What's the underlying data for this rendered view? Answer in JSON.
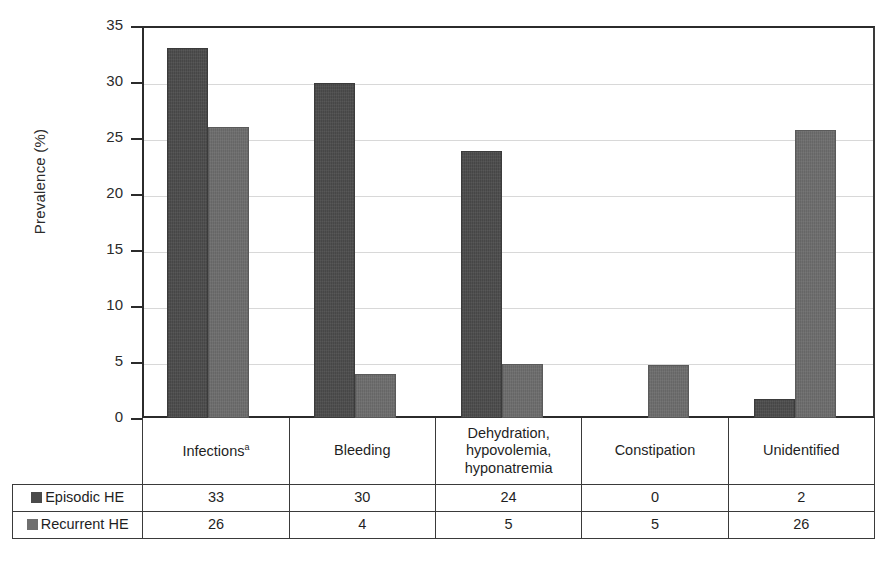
{
  "chart_data": {
    "type": "bar",
    "title": "",
    "xlabel": "",
    "ylabel": "Prevalence (%)",
    "ylim": [
      0,
      35
    ],
    "yticks": [
      0,
      5,
      10,
      15,
      20,
      25,
      30,
      35
    ],
    "ytick_labels": [
      "0",
      "5",
      "10",
      "15",
      "20",
      "25",
      "30",
      "35"
    ],
    "grid": true,
    "grid_axis": "y",
    "legend_position": "table-left-column",
    "categories": [
      "Infections",
      "Bleeding",
      "Dehydration, hypovolemia, hyponatremia",
      "Constipation",
      "Unidentified"
    ],
    "category_labels": [
      "Infectionsᵃ",
      "Bleeding",
      "Dehydration, hypovolemia, hyponatremia",
      "Constipation",
      "Unidentified"
    ],
    "series": [
      {
        "name": "Episodic HE",
        "color": "#4a4a4a",
        "values": [
          33,
          30,
          24,
          0,
          2
        ],
        "drawn_values": [
          33.0,
          29.9,
          23.8,
          0,
          1.7
        ]
      },
      {
        "name": "Recurrent HE",
        "color": "#6b6b6b",
        "values": [
          26,
          4,
          5,
          5,
          26
        ],
        "drawn_values": [
          26.0,
          3.9,
          4.8,
          4.7,
          25.7
        ]
      }
    ],
    "footnote_marker": "a"
  },
  "chart": {
    "ylabel": "Prevalence (%)"
  },
  "table": {
    "header_blank": "",
    "columns": [
      "Infections",
      "Bleeding",
      "Dehydration, hypovolemia, hyponatremia",
      "Constipation",
      "Unidentified"
    ],
    "header_cells": [
      {
        "text": "Infections",
        "sup": "a"
      },
      {
        "text": "Bleeding",
        "sup": ""
      },
      {
        "text": "Dehydration, hypovolemia, hyponatremia",
        "sup": ""
      },
      {
        "text": "Constipation",
        "sup": ""
      },
      {
        "text": "Unidentified",
        "sup": ""
      }
    ],
    "rows": [
      {
        "label": "Episodic HE",
        "swatch_color": "#4a4a4a",
        "values": [
          "33",
          "30",
          "24",
          "0",
          "2"
        ]
      },
      {
        "label": "Recurrent HE",
        "swatch_color": "#6f6f6f",
        "values": [
          "26",
          "4",
          "5",
          "5",
          "26"
        ]
      }
    ]
  },
  "caption": {
    "text": ""
  }
}
